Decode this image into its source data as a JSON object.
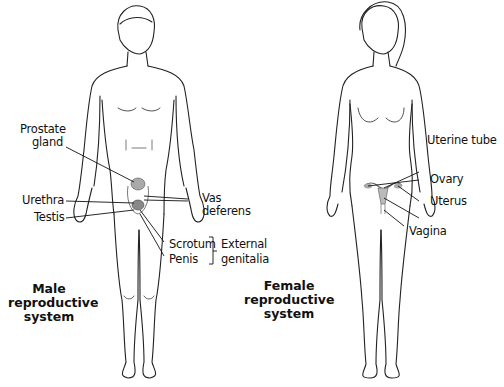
{
  "diagram": {
    "male": {
      "title_lines": [
        "Male",
        "reproductive",
        "system"
      ],
      "labels": {
        "prostate_line1": "Prostate",
        "prostate_line2": "gland",
        "urethra": "Urethra",
        "testis": "Testis",
        "vas_line1": "Vas",
        "vas_line2": "deferens",
        "scrotum": "Scrotum",
        "penis": "Penis",
        "external_line1": "External",
        "external_line2": "genitalia"
      }
    },
    "female": {
      "title_lines": [
        "Female",
        "reproductive",
        "system"
      ],
      "labels": {
        "uterine_tube": "Uterine tube",
        "ovary": "Ovary",
        "uterus": "Uterus",
        "vagina": "Vagina"
      }
    },
    "colors": {
      "outline": "#222222",
      "organ_fill": "#a9a9a9",
      "leader_line": "#111111"
    }
  }
}
